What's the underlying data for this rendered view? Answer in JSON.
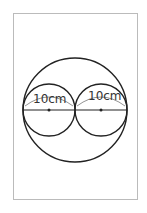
{
  "diagram": {
    "type": "geometry",
    "labels": {
      "left_diameter": "10cm",
      "right_diameter": "10cm"
    },
    "colors": {
      "stroke": "#222222",
      "frame": "#bbbbbb"
    }
  }
}
